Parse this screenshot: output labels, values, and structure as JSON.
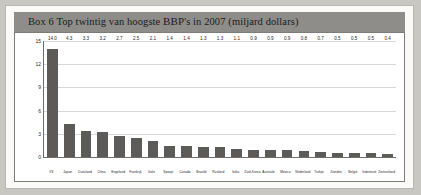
{
  "box": {
    "title_prefix": "Box 6 Top twintig van hoogste ",
    "title_smallcaps": "BBP",
    "title_suffix": "'s in 2007 (miljard dollars)"
  },
  "chart_data": {
    "type": "bar",
    "title": "Box 6 Top twintig van hoogste BBP's in 2007 (miljard dollars)",
    "xlabel": "",
    "ylabel": "",
    "ylim": [
      0,
      15
    ],
    "yticks": [
      0,
      3,
      6,
      9,
      12,
      15
    ],
    "grid": true,
    "legend": "none",
    "bar_color": "#5c5b59",
    "categories": [
      "VS",
      "Japan",
      "Duitsland",
      "China",
      "Engeland",
      "Frankrijk",
      "Italië",
      "Spanje",
      "Canada",
      "Brazilië",
      "Rusland",
      "India",
      "Zuid-Korea",
      "Australië",
      "Mexico",
      "Nederland",
      "Turkije",
      "Zweden",
      "België",
      "Indonesië",
      "Zwitserland"
    ],
    "values": [
      14.0,
      4.3,
      3.3,
      3.2,
      2.7,
      2.5,
      2.1,
      1.4,
      1.4,
      1.3,
      1.3,
      1.1,
      0.9,
      0.9,
      0.9,
      0.8,
      0.7,
      0.5,
      0.5,
      0.5,
      0.4
    ],
    "value_labels": [
      "14.0",
      "4.3",
      "3.3",
      "3.2",
      "2.7",
      "2.5",
      "2.1",
      "1.4",
      "1.4",
      "1.3",
      "1.3",
      "1.1",
      "0.9",
      "0.9",
      "0.9",
      "0.8",
      "0.7",
      "0.5",
      "0.5",
      "0.5",
      "0.4"
    ]
  }
}
